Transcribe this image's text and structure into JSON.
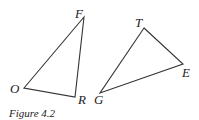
{
  "figure": {
    "caption": "Figure 4.2",
    "stroke_color": "#333333",
    "triangles": [
      {
        "name": "FOR",
        "vertices": [
          {
            "label": "F",
            "x": 84,
            "y": 17,
            "lx": 75,
            "ly": 18
          },
          {
            "label": "O",
            "x": 24,
            "y": 88,
            "lx": 10,
            "ly": 93
          },
          {
            "label": "R",
            "x": 75,
            "y": 97,
            "lx": 78,
            "ly": 104
          }
        ]
      },
      {
        "name": "TEG",
        "vertices": [
          {
            "label": "T",
            "x": 144,
            "y": 28,
            "lx": 135,
            "ly": 27
          },
          {
            "label": "E",
            "x": 183,
            "y": 64,
            "lx": 182,
            "ly": 77
          },
          {
            "label": "G",
            "x": 100,
            "y": 93,
            "lx": 94,
            "ly": 104
          }
        ]
      }
    ]
  }
}
